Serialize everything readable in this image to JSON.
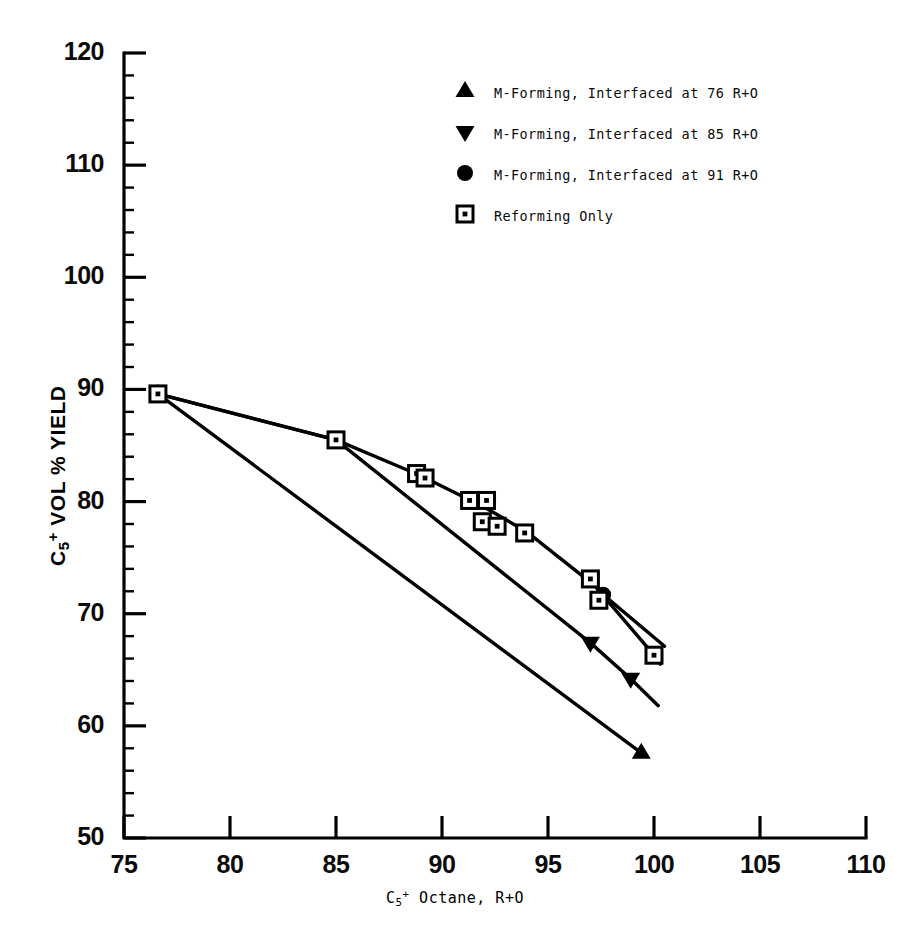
{
  "chart_data": {
    "type": "scatter",
    "title": "",
    "xlabel": "C5+ Octane, R+O",
    "ylabel": "C5+ VOL % YIELD",
    "xlim": [
      75,
      110
    ],
    "ylim": [
      50,
      120
    ],
    "xticks": [
      75,
      80,
      85,
      90,
      95,
      100,
      105,
      110
    ],
    "yticks": [
      50,
      60,
      70,
      80,
      90,
      100,
      110,
      120
    ],
    "xtick_labels": [
      "75",
      "80",
      "85",
      "90",
      "95",
      "100",
      "105",
      "110"
    ],
    "ytick_labels": [
      "50",
      "60",
      "70",
      "80",
      "90",
      "100",
      "110",
      "120"
    ],
    "x_minor_step": 1,
    "y_minor_step": 2,
    "grid": false,
    "legend_position": "upper center",
    "series": [
      {
        "name": "M-Forming, Interfaced at 76 R+O",
        "marker": "triangle-up",
        "points": [
          {
            "x": 76.6,
            "y": 89.6
          },
          {
            "x": 99.4,
            "y": 57.6
          }
        ],
        "line_points": [
          {
            "x": 76.6,
            "y": 89.6
          },
          {
            "x": 99.4,
            "y": 57.6
          }
        ]
      },
      {
        "name": "M-Forming, Interfaced at 85 R+O",
        "marker": "triangle-down",
        "points": [
          {
            "x": 97.0,
            "y": 67.4
          },
          {
            "x": 98.9,
            "y": 64.2
          }
        ],
        "line_points": [
          {
            "x": 76.6,
            "y": 89.6
          },
          {
            "x": 85.0,
            "y": 85.5
          },
          {
            "x": 97.0,
            "y": 67.4
          },
          {
            "x": 98.9,
            "y": 64.2
          },
          {
            "x": 100.2,
            "y": 61.8
          }
        ]
      },
      {
        "name": "M-Forming, Interfaced at 91 R+O",
        "marker": "circle",
        "points": [
          {
            "x": 97.6,
            "y": 71.7
          }
        ],
        "line_points": [
          {
            "x": 97.6,
            "y": 71.7
          },
          {
            "x": 100.5,
            "y": 67.1
          }
        ]
      },
      {
        "name": "Reforming Only",
        "marker": "square-dot",
        "points": [
          {
            "x": 76.6,
            "y": 89.6
          },
          {
            "x": 85.0,
            "y": 85.5
          },
          {
            "x": 88.8,
            "y": 82.5
          },
          {
            "x": 89.2,
            "y": 82.1
          },
          {
            "x": 91.3,
            "y": 80.1
          },
          {
            "x": 92.1,
            "y": 80.1
          },
          {
            "x": 91.9,
            "y": 78.2
          },
          {
            "x": 92.6,
            "y": 77.8
          },
          {
            "x": 93.9,
            "y": 77.2
          },
          {
            "x": 97.0,
            "y": 73.1
          },
          {
            "x": 97.4,
            "y": 71.2
          },
          {
            "x": 100.0,
            "y": 66.3
          }
        ],
        "line_points": [
          {
            "x": 76.6,
            "y": 89.6
          },
          {
            "x": 85.0,
            "y": 85.5
          },
          {
            "x": 89.0,
            "y": 82.3
          },
          {
            "x": 92.0,
            "y": 79.5
          },
          {
            "x": 94.0,
            "y": 77.3
          },
          {
            "x": 97.2,
            "y": 72.5
          },
          {
            "x": 100.0,
            "y": 66.3
          },
          {
            "x": 100.3,
            "y": 65.5
          }
        ]
      }
    ]
  },
  "legend": {
    "items": [
      {
        "marker": "triangle-up-icon",
        "label": "M-Forming, Interfaced at 76 R+O"
      },
      {
        "marker": "triangle-down-icon",
        "label": "M-Forming, Interfaced at 85 R+O"
      },
      {
        "marker": "circle-icon",
        "label": "M-Forming, Interfaced at 91 R+O"
      },
      {
        "marker": "square-dot-icon",
        "label": "Reforming Only"
      }
    ]
  },
  "axes": {
    "y_title_parts": {
      "c": "C",
      "sub": "5",
      "sup": "+",
      "rest": " VOL % YIELD"
    },
    "x_title_parts": {
      "c": "C",
      "sub": "5",
      "sup": "+",
      "rest": " Octane, R+O"
    }
  },
  "colors": {
    "ink": "#000000",
    "background": "#ffffff"
  }
}
